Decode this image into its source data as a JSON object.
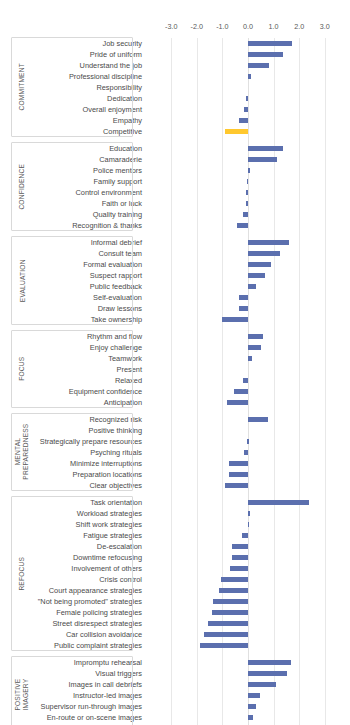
{
  "chart_data": {
    "type": "bar",
    "orientation": "horizontal",
    "title": "",
    "subtitle": "",
    "xlabel": "",
    "ylabel": "",
    "xlim": [
      -3.0,
      3.0
    ],
    "grid": true,
    "legend_position": "none",
    "axis_position": "top",
    "tick_labels": [
      "-3.0",
      "-2.0",
      "-1.0",
      "0.0",
      "1.0",
      "2.0",
      "3.0"
    ],
    "tick_values": [
      -3.0,
      -2.0,
      -1.0,
      0.0,
      1.0,
      2.0,
      3.0
    ],
    "colors": {
      "bar": "#5b6fae",
      "accent_bar": "#ffc82e",
      "gridline": "#e8e8e8",
      "label_text": "#4a4a4a",
      "tick_text": "#595959",
      "group_border": "#d9d9d9"
    },
    "groups": [
      {
        "name": "COMMITMENT",
        "categories": [
          "Job security",
          "Pride of uniform",
          "Understand the job",
          "Professional discipline",
          "Responsibility",
          "Dedication",
          "Overall enjoyment",
          "Empathy",
          "Competitive"
        ],
        "values": [
          1.7,
          1.35,
          0.83,
          0.11,
          0.0,
          -0.09,
          -0.17,
          -0.34,
          -0.9
        ],
        "highlight": [
          "Competitive"
        ]
      },
      {
        "name": "CONFIDENCE",
        "categories": [
          "Education",
          "Camaraderie",
          "Police mentors",
          "Family support",
          "Control environment",
          "Faith or luck",
          "Quality training",
          "Recognition & thanks"
        ],
        "values": [
          1.35,
          1.12,
          0.06,
          -0.04,
          -0.06,
          -0.08,
          -0.2,
          -0.42
        ],
        "highlight": []
      },
      {
        "name": "EVALUATION",
        "categories": [
          "Informal debrief",
          "Consult team",
          "Formal evaluation",
          "Suspect rapport",
          "Public feedback",
          "Self-evaluation",
          "Draw lessons",
          "Take ownership"
        ],
        "values": [
          1.6,
          1.24,
          0.9,
          0.65,
          0.3,
          -0.35,
          -0.37,
          -1.0
        ],
        "highlight": []
      },
      {
        "name": "FOCUS",
        "categories": [
          "Rhythm and flow",
          "Enjoy challenge",
          "Teamwork",
          "Present",
          "Relaxed",
          "Equipment confidence",
          "Anticipation"
        ],
        "values": [
          0.6,
          0.52,
          0.16,
          0.0,
          -0.18,
          -0.53,
          -0.82
        ],
        "highlight": []
      },
      {
        "name": "MENTAL PREPAREDNESS",
        "categories": [
          "Recognized risk",
          "Positive thinking",
          "Strategically prepare resources",
          "Psyching rituals",
          "Minimize interruptions",
          "Preparation locations",
          "Clear objectives"
        ],
        "values": [
          0.8,
          0.0,
          -0.02,
          -0.15,
          -0.73,
          -0.76,
          -0.88
        ],
        "highlight": []
      },
      {
        "name": "REFOCUS",
        "categories": [
          "Task orientation",
          "Workload strategies",
          "Shift work strategies",
          "Fatigue strategies",
          "De-escalation",
          "Downtime refocusing",
          "Involvement of others",
          "Crisis control",
          "Court appearance strategies",
          "\"Not being promoted\" strategies",
          "Female policing strategies",
          "Street disrespect strategies",
          "Car collision avoidance",
          "Public complaint strategies"
        ],
        "values": [
          2.4,
          0.08,
          0.05,
          -0.23,
          -0.62,
          -0.63,
          -0.7,
          -1.05,
          -1.12,
          -1.38,
          -1.42,
          -1.57,
          -1.72,
          -1.88
        ],
        "highlight": []
      },
      {
        "name": "POSITIVE IMAGERY",
        "categories": [
          "Impromptu rehearsal",
          "Visual triggers",
          "Images in call debriefs",
          "Instructor-led images",
          "Supervisor run-through images",
          "En-route or on-scene images",
          "Court preparation images"
        ],
        "values": [
          1.68,
          1.53,
          1.1,
          0.48,
          0.33,
          0.21,
          0.18
        ],
        "highlight": []
      }
    ]
  }
}
